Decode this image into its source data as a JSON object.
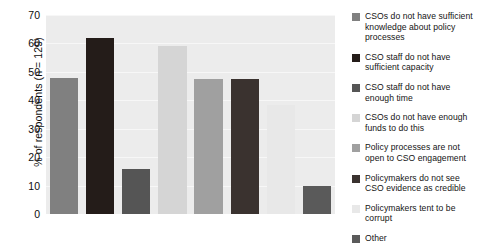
{
  "chart_data": {
    "type": "bar",
    "title": "",
    "subtitle": "",
    "xlabel": "",
    "ylabel": "% of respondents (n = 129)",
    "ylim": [
      0,
      70
    ],
    "ytick_values": [
      0,
      10,
      20,
      30,
      40,
      50,
      60,
      70
    ],
    "ytick_labels": [
      "0",
      "10",
      "20",
      "30",
      "40",
      "50",
      "60",
      "70"
    ],
    "grid": true,
    "grid_axis": "y",
    "legend_position": "right",
    "plot_background_color": "#ececec",
    "figure_background_color": "#ffffff",
    "gridline_color": "#f7f7f7",
    "categories": [
      "CSOs do not have sufficient knowledge about policy processes",
      "CSO staff do not have sufficient capacity",
      "CSO staff do not have enough time",
      "CSOs do not have enough funds to do this",
      "Policy processes are not open to CSO engagement",
      "Policymakers do not see CSO evidence as credible",
      "Policymakers tent to be corrupt",
      "Other"
    ],
    "values": [
      48,
      62,
      16,
      59,
      47.5,
      47.5,
      38.5,
      10
    ],
    "colors": [
      "#808080",
      "#241c19",
      "#555555",
      "#d5d5d5",
      "#a0a0a0",
      "#3a322f",
      "#e8e8e8",
      "#5a5a5a"
    ]
  },
  "legend": {
    "items": [
      {
        "label": "CSOs do not have sufficient knowledge about policy processes",
        "color": "#808080"
      },
      {
        "label": "CSO staff do not have sufficient capacity",
        "color": "#241c19"
      },
      {
        "label": "CSO staff do not have enough time",
        "color": "#555555"
      },
      {
        "label": "CSOs do not have enough funds to do this",
        "color": "#d5d5d5"
      },
      {
        "label": "Policy processes are not open to CSO engagement",
        "color": "#a0a0a0"
      },
      {
        "label": "Policymakers do not see CSO evidence as credible",
        "color": "#3a322f"
      },
      {
        "label": "Policymakers tent to be corrupt",
        "color": "#e8e8e8"
      },
      {
        "label": "Other",
        "color": "#5a5a5a"
      }
    ]
  }
}
